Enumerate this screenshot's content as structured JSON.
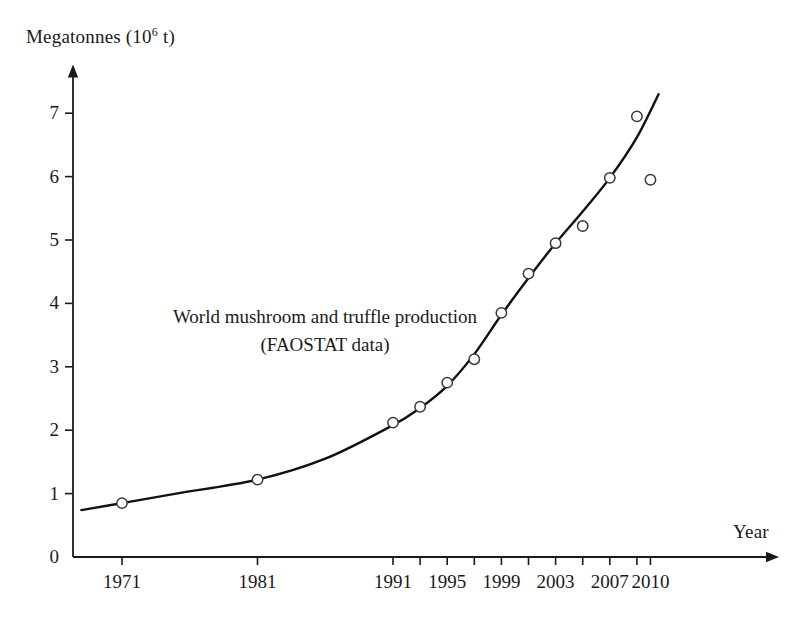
{
  "chart_data": {
    "type": "scatter",
    "title": "",
    "annotation_lines": [
      "World mushroom and truffle production",
      "(FAOSTAT data)"
    ],
    "xlabel": "Year",
    "ylabel_text": "Megatonnes (10",
    "ylabel_sup": "6",
    "ylabel_tail": " t)",
    "ylabel_full": "Megatonnes (10^6 t)",
    "xlim": [
      1968,
      2011.5
    ],
    "ylim": [
      0,
      7.5
    ],
    "grid": false,
    "legend": false,
    "x_tick_values": [
      1971,
      1981,
      1991,
      1993,
      1995,
      1997,
      1999,
      2001,
      2003,
      2005,
      2007,
      2009,
      2010
    ],
    "x_tick_labels": [
      {
        "value": 1971,
        "label": "1971"
      },
      {
        "value": 1981,
        "label": "1981"
      },
      {
        "value": 1991,
        "label": "1991"
      },
      {
        "value": 1995,
        "label": "1995"
      },
      {
        "value": 1999,
        "label": "1999"
      },
      {
        "value": 2003,
        "label": "2003"
      },
      {
        "value": 2007,
        "label": "2007"
      },
      {
        "value": 2010,
        "label": "2010"
      }
    ],
    "y_tick_labels": [
      "0",
      "1",
      "2",
      "3",
      "4",
      "5",
      "6",
      "7"
    ],
    "y_tick_values": [
      0,
      1,
      2,
      3,
      4,
      5,
      6,
      7
    ],
    "series": [
      {
        "name": "World mushroom and truffle production",
        "marker": "open-circle",
        "x": [
          1971,
          1981,
          1991,
          1993,
          1995,
          1997,
          1999,
          2001,
          2003,
          2005,
          2007,
          2009,
          2010
        ],
        "values": [
          0.85,
          1.22,
          2.12,
          2.37,
          2.75,
          3.12,
          3.85,
          4.47,
          4.95,
          5.22,
          5.98,
          6.95,
          5.95
        ]
      },
      {
        "name": "fitted trend curve",
        "type": "line",
        "x": [
          1968,
          1971,
          1975,
          1981,
          1986,
          1991,
          1993,
          1995,
          1997,
          1999,
          2001,
          2003,
          2005,
          2007,
          2009,
          2010.6
        ],
        "values": [
          0.74,
          0.85,
          1.0,
          1.22,
          1.55,
          2.08,
          2.35,
          2.7,
          3.2,
          3.82,
          4.4,
          4.95,
          5.45,
          5.98,
          6.62,
          7.3
        ]
      }
    ],
    "colors": {
      "axis": "#1a1a1a",
      "curve": "#111111",
      "marker_stroke": "#3a3a3a",
      "background": "#ffffff"
    }
  }
}
